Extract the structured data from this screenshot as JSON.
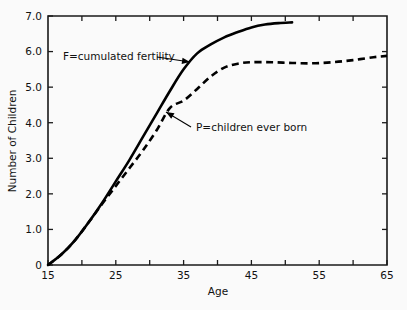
{
  "chart_data": {
    "type": "line",
    "title": "",
    "xlabel": "Age",
    "ylabel": "Number of Children",
    "xlim": [
      15,
      65
    ],
    "ylim": [
      0,
      7.0
    ],
    "grid": false,
    "legend_position": "inline-annotations",
    "x_ticks": [
      15,
      20,
      25,
      30,
      35,
      40,
      45,
      50,
      55,
      60,
      65
    ],
    "x_tick_labels": [
      "15",
      "",
      "25",
      "",
      "35",
      "",
      "45",
      "",
      "55",
      "",
      "65"
    ],
    "y_ticks": [
      0,
      1.0,
      2.0,
      3.0,
      4.0,
      5.0,
      6.0,
      7.0
    ],
    "y_tick_labels": [
      "0",
      "1.0",
      "2.0",
      "3.0",
      "4.0",
      "5.0",
      "6.0",
      "7.0"
    ],
    "series": [
      {
        "name": "F=cumulated fertility",
        "key": "F",
        "style": "solid",
        "color": "#000000",
        "x": [
          15,
          17,
          19,
          21,
          23,
          25,
          27,
          29,
          31,
          33,
          35,
          37,
          39,
          41,
          43,
          45,
          47,
          49,
          51
        ],
        "values": [
          0.0,
          0.3,
          0.7,
          1.2,
          1.75,
          2.35,
          2.95,
          3.6,
          4.25,
          4.9,
          5.5,
          5.95,
          6.2,
          6.4,
          6.55,
          6.68,
          6.76,
          6.8,
          6.82
        ]
      },
      {
        "name": "P=children ever born",
        "key": "P",
        "style": "dashed",
        "color": "#000000",
        "x": [
          15,
          17,
          19,
          21,
          23,
          25,
          27,
          29,
          31,
          33,
          35,
          37,
          39,
          41,
          43,
          45,
          48,
          51,
          54,
          57,
          60,
          63,
          65
        ],
        "values": [
          0.0,
          0.3,
          0.7,
          1.2,
          1.72,
          2.22,
          2.72,
          3.22,
          3.78,
          4.42,
          4.62,
          4.95,
          5.3,
          5.55,
          5.66,
          5.7,
          5.7,
          5.68,
          5.67,
          5.7,
          5.76,
          5.84,
          5.88
        ]
      }
    ],
    "annotations": [
      {
        "key": "F-annotation",
        "text": "F=cumulated fertility",
        "text_anchor_x": 63,
        "text_anchor_y": 60,
        "leader_from_x": 157,
        "leader_from_y": 57,
        "leader_to_x": 190,
        "leader_to_y": 62
      },
      {
        "key": "P-annotation",
        "text": "P=children ever born",
        "text_anchor_x": 196,
        "text_anchor_y": 131,
        "leader_from_x": 191,
        "leader_from_y": 127,
        "leader_to_x": 166,
        "leader_to_y": 112
      }
    ]
  },
  "axes": {
    "x_title": "Age",
    "y_title": "Number of Children"
  },
  "figure": {
    "background_color": "#fafafa",
    "ink_color": "#000000"
  }
}
